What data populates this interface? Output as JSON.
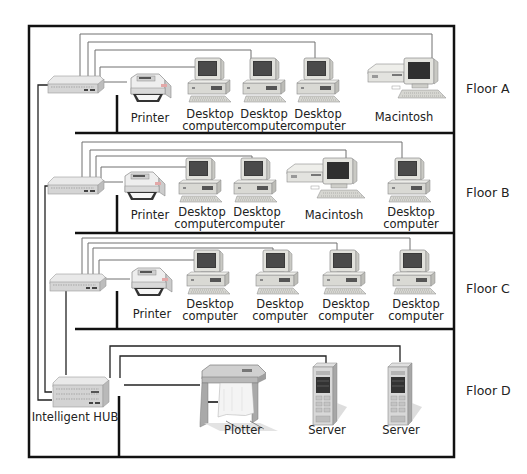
{
  "diagram": {
    "colors": {
      "wire": "#707070",
      "backbone": "#111111",
      "building": "#111111",
      "label": "#222222"
    },
    "floors": [
      {
        "id": "A",
        "label": "Floor A",
        "hub_label": "",
        "devices": [
          {
            "type": "printer",
            "label": "Printer"
          },
          {
            "type": "desktop",
            "label_line1": "Desktop",
            "label_line2": "computer"
          },
          {
            "type": "desktop",
            "label_line1": "Desktop",
            "label_line2": "computer"
          },
          {
            "type": "desktop",
            "label_line1": "Desktop",
            "label_line2": "computer"
          },
          {
            "type": "macintosh",
            "label": "Macintosh"
          }
        ]
      },
      {
        "id": "B",
        "label": "Floor B",
        "hub_label": "",
        "devices": [
          {
            "type": "printer",
            "label": "Printer"
          },
          {
            "type": "desktop",
            "label_line1": "Desktop",
            "label_line2": "computer"
          },
          {
            "type": "desktop",
            "label_line1": "Desktop",
            "label_line2": "computer"
          },
          {
            "type": "macintosh",
            "label": "Macintosh"
          },
          {
            "type": "desktop",
            "label_line1": "Desktop",
            "label_line2": "computer"
          }
        ]
      },
      {
        "id": "C",
        "label": "Floor C",
        "hub_label": "",
        "devices": [
          {
            "type": "printer",
            "label": "Printer"
          },
          {
            "type": "desktop",
            "label_line1": "Desktop",
            "label_line2": "computer"
          },
          {
            "type": "desktop",
            "label_line1": "Desktop",
            "label_line2": "computer"
          },
          {
            "type": "desktop",
            "label_line1": "Desktop",
            "label_line2": "computer"
          },
          {
            "type": "desktop",
            "label_line1": "Desktop",
            "label_line2": "computer"
          }
        ]
      },
      {
        "id": "D",
        "label": "Floor D",
        "hub_label": "Intelligent HUB",
        "devices": [
          {
            "type": "plotter",
            "label": "Plotter"
          },
          {
            "type": "server",
            "label": "Server"
          },
          {
            "type": "server",
            "label": "Server"
          }
        ]
      }
    ]
  }
}
